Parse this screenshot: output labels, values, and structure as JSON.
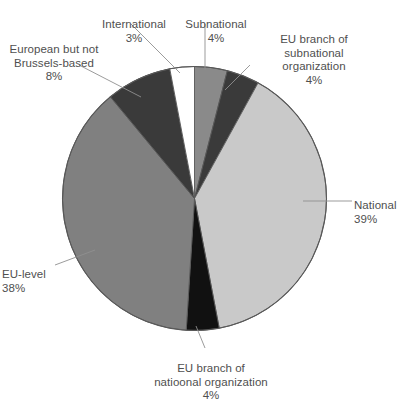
{
  "chart_data": {
    "type": "pie",
    "title": "",
    "subtitle": "",
    "xlabel": "",
    "ylabel": "",
    "legend_position": "callout-labels",
    "grid": false,
    "unit": "%",
    "total": 100,
    "start_angle_deg": 0,
    "direction": "clockwise",
    "categories": [
      "Subnational",
      "EU branch of subnational organization",
      "National",
      "EU branch of natioonal organization",
      "EU-level",
      "European but not Brussels-based",
      "International"
    ],
    "values": [
      4,
      4,
      39,
      4,
      38,
      8,
      3
    ],
    "slices": [
      {
        "label": "Subnational",
        "value": 4,
        "value_text": "4%",
        "color": "#8a8a8a",
        "start_deg": 0,
        "end_deg": 14.4
      },
      {
        "label": "EU branch of subnational organization",
        "value": 4,
        "value_text": "4%",
        "color": "#3a3a3a",
        "start_deg": 14.4,
        "end_deg": 28.8
      },
      {
        "label": "National",
        "value": 39,
        "value_text": "39%",
        "color": "#c9c9c9",
        "start_deg": 28.8,
        "end_deg": 169.2
      },
      {
        "label": "EU branch of natioonal organization",
        "value": 4,
        "value_text": "4%",
        "color": "#111111",
        "start_deg": 169.2,
        "end_deg": 183.6
      },
      {
        "label": "EU-level",
        "value": 38,
        "value_text": "38%",
        "color": "#808080",
        "start_deg": 183.6,
        "end_deg": 320.4
      },
      {
        "label": "European but not Brussels-based",
        "value": 8,
        "value_text": "8%",
        "color": "#3a3a3a",
        "start_deg": 320.4,
        "end_deg": 349.2
      },
      {
        "label": "International",
        "value": 3,
        "value_text": "3%",
        "color": "#ffffff",
        "start_deg": 349.2,
        "end_deg": 360
      }
    ]
  },
  "labels": {
    "international": {
      "name": "International",
      "pct": "3%"
    },
    "subnational": {
      "name": "Subnational",
      "pct": "4%"
    },
    "eu_branch_subnational": {
      "name": "EU branch of\nsubnational\norganization",
      "pct": "4%"
    },
    "european_not_brussels": {
      "name": "European but not\nBrussels-based",
      "pct": "8%"
    },
    "national": {
      "name": "National",
      "pct": "39%"
    },
    "eu_level": {
      "name": "EU-level",
      "pct": "38%"
    },
    "eu_branch_national": {
      "name": "EU branch of\nnatioonal organization",
      "pct": "4%"
    }
  },
  "style": {
    "outline_color": "#585858",
    "leader_color": "#909090",
    "text_color": "#4f4f4f",
    "background": "#ffffff"
  }
}
